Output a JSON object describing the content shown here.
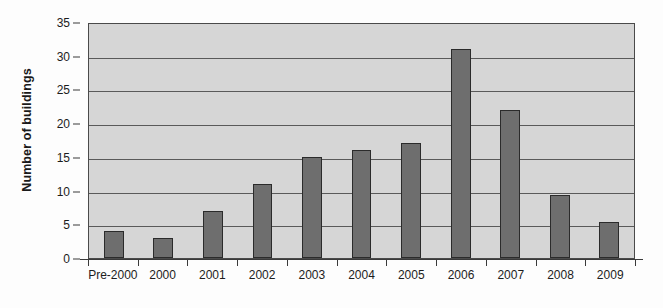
{
  "chart_data": {
    "type": "bar",
    "title": "",
    "xlabel": "",
    "ylabel": "Number of buildings",
    "categories": [
      "Pre-2000",
      "2000",
      "2001",
      "2002",
      "2003",
      "2004",
      "2005",
      "2006",
      "2007",
      "2008",
      "2009"
    ],
    "values": [
      4,
      3,
      7,
      11,
      15,
      16,
      17,
      31,
      22,
      9.4,
      5.3
    ],
    "ylim": [
      0,
      35
    ],
    "yticks": [
      0,
      5,
      10,
      15,
      20,
      25,
      30,
      35
    ],
    "ytick_labels": [
      "0",
      "5",
      "10",
      "15",
      "20",
      "25",
      "30",
      "35"
    ],
    "grid": true,
    "grid_axis": "y",
    "legend": false,
    "legend_position": "none",
    "bar_color": "#6e6e6e",
    "bar_edge_color": "#2b2b2b",
    "plot_background": "#d6d6d6",
    "gridline_color": "#5a5a5a",
    "axis_color": "#3a3a3a",
    "text_color": "#1c1c1c"
  }
}
